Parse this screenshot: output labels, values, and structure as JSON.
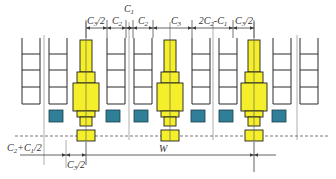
{
  "colors": {
    "rack_stroke": "#2b2b2b",
    "column_fill": "#f4ef2a",
    "column_stroke": "#1d1d1d",
    "pallet_fill": "#2f7f98",
    "guide_line": "#9a9a9a",
    "dim_line": "#3a3a3a"
  },
  "top_dimensions": [
    {
      "id": "d1",
      "label": "C3/2",
      "x1": 86,
      "x2": 107,
      "label_x": 96
    },
    {
      "id": "d2",
      "label": "C2",
      "x1": 107,
      "x2": 126,
      "label_x": 117
    },
    {
      "id": "d3",
      "label": "C1",
      "x1": 126,
      "x2": 133,
      "label_x": 129
    },
    {
      "id": "d4",
      "label": "C2",
      "x1": 133,
      "x2": 153,
      "label_x": 143
    },
    {
      "id": "d5",
      "label": "C3",
      "x1": 153,
      "x2": 192,
      "label_x": 176
    },
    {
      "id": "d6",
      "label": "2C2-C1",
      "x1": 192,
      "x2": 233,
      "label_x": 213
    },
    {
      "id": "d7",
      "label": "C3/2",
      "x1": 233,
      "x2": 254,
      "label_x": 244
    }
  ],
  "bottom_dimensions": [
    {
      "id": "b1",
      "label": "C2+C1/2",
      "x1": 44,
      "x2": 66
    },
    {
      "id": "b2",
      "label": "C3/2",
      "x1": 66,
      "x2": 86
    },
    {
      "id": "b3",
      "label": "W",
      "x1": 86,
      "x2": 254
    }
  ],
  "racks_x": [
    22,
    49,
    107,
    134,
    192,
    219,
    273,
    300
  ],
  "columns_x": [
    86,
    170,
    254
  ],
  "pallets_x": [
    56,
    113,
    141,
    198,
    226,
    279
  ],
  "labels": {
    "C1": "C",
    "C1_sub": "1",
    "W": "W"
  }
}
